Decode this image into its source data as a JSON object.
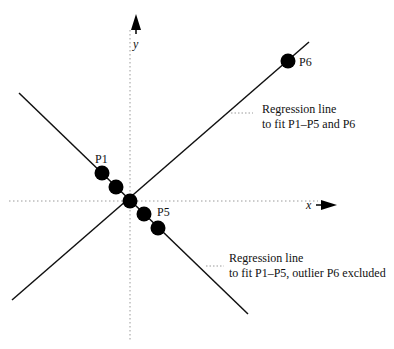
{
  "diagram": {
    "axes": {
      "x_label": "x",
      "y_label": "y"
    },
    "points": [
      {
        "label": "P1",
        "cx": 102,
        "cy": 173
      },
      {
        "label": "",
        "cx": 116,
        "cy": 187
      },
      {
        "label": "",
        "cx": 130,
        "cy": 201
      },
      {
        "label": "",
        "cx": 144,
        "cy": 214
      },
      {
        "label": "P5",
        "cx": 158,
        "cy": 228
      },
      {
        "label": "P6",
        "cx": 288,
        "cy": 61
      }
    ],
    "point_labels": {
      "p1": "P1",
      "p5": "P5",
      "p6": "P6"
    },
    "annotations": {
      "upper": {
        "line1": "Regression line",
        "line2": "to fit P1–P5 and P6"
      },
      "lower": {
        "line1": "Regression line",
        "line2": "to fit P1–P5, outlier P6 excluded"
      }
    },
    "colors": {
      "line": "#111111",
      "axis": "#9a9a9a",
      "point": "#000000"
    }
  }
}
